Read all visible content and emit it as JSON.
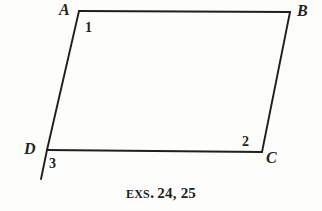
{
  "figure": {
    "name": "parallelogram-abcd-with-exterior-angle",
    "background_color": "#fdfdfc",
    "stroke_color": "#1f1f1f",
    "stroke_width": 1.9,
    "canvas": {
      "width": 322,
      "height": 211
    },
    "vertices": [
      {
        "id": "A",
        "label": "A",
        "x": 79,
        "y": 11,
        "label_x": 59,
        "label_y": 2
      },
      {
        "id": "B",
        "label": "B",
        "x": 290,
        "y": 12,
        "label_x": 297,
        "label_y": 3
      },
      {
        "id": "C",
        "label": "C",
        "x": 262,
        "y": 152,
        "label_x": 266,
        "label_y": 150
      },
      {
        "id": "D",
        "label": "D",
        "x": 47,
        "y": 150,
        "label_x": 24,
        "label_y": 141
      }
    ],
    "edges": [
      {
        "id": "AB",
        "from": "A",
        "to": "B",
        "x1": 79,
        "y1": 11,
        "x2": 290,
        "y2": 12
      },
      {
        "id": "BC",
        "from": "B",
        "to": "C",
        "x1": 290,
        "y1": 12,
        "x2": 262,
        "y2": 152
      },
      {
        "id": "CD",
        "from": "C",
        "to": "D",
        "x1": 262,
        "y1": 152,
        "x2": 47,
        "y2": 150
      },
      {
        "id": "DA",
        "from": "D",
        "to": "A",
        "x1": 47,
        "y1": 150,
        "x2": 79,
        "y2": 11
      }
    ],
    "extensions": [
      {
        "id": "DA-extended-beyond-D",
        "x1": 47,
        "y1": 150,
        "x2": 41,
        "y2": 179
      }
    ],
    "angle_labels": [
      {
        "id": "1",
        "label": "1",
        "at_vertex": "A",
        "kind": "interior",
        "x": 85,
        "y": 21
      },
      {
        "id": "2",
        "label": "2",
        "at_vertex": "C",
        "kind": "interior",
        "x": 242,
        "y": 135
      },
      {
        "id": "3",
        "label": "3",
        "at_vertex": "D",
        "kind": "exterior",
        "x": 49,
        "y": 157
      }
    ]
  },
  "caption": {
    "abbrev": "Exs.",
    "numbers": "24, 25",
    "full_text": "Exs. 24, 25"
  }
}
